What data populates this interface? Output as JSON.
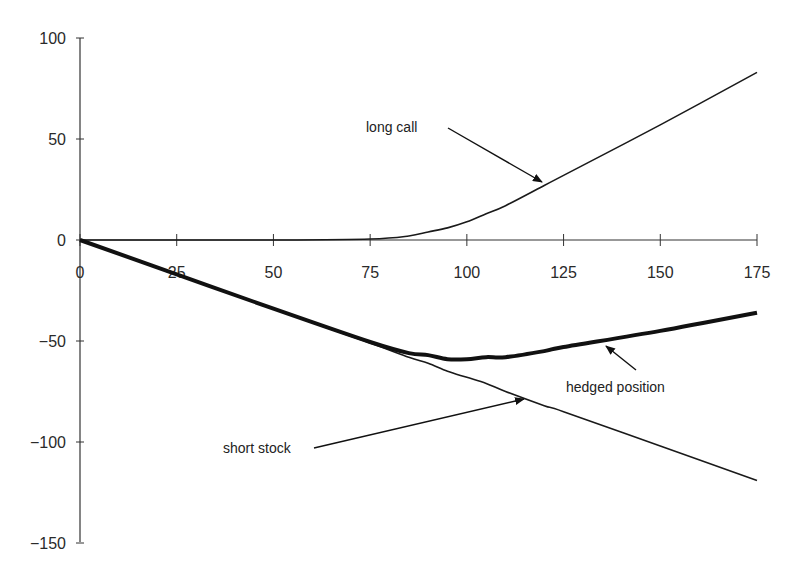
{
  "chart_data": {
    "type": "line",
    "title": "",
    "xlabel": "",
    "ylabel": "",
    "xlim": [
      0,
      175
    ],
    "ylim": [
      -150,
      100
    ],
    "x_ticks": [
      0,
      25,
      50,
      75,
      100,
      125,
      150,
      175
    ],
    "y_ticks": [
      100,
      50,
      0,
      -50,
      -100,
      -150
    ],
    "grid": false,
    "legend": "none (inline arrow annotations)",
    "x": [
      0,
      25,
      50,
      75,
      85,
      90,
      95,
      100,
      105,
      110,
      120,
      125,
      150,
      175
    ],
    "series": [
      {
        "name": "long call",
        "values": [
          0,
          0,
          0,
          0.5,
          2,
          4,
          6,
          9,
          13,
          17,
          27,
          32,
          57,
          83
        ],
        "style": "thin"
      },
      {
        "name": "short stock",
        "values": [
          0,
          -17,
          -34,
          -51,
          -58,
          -61,
          -65,
          -68,
          -71,
          -75,
          -82,
          -85,
          -102,
          -119
        ],
        "style": "thin"
      },
      {
        "name": "hedged position",
        "values": [
          0,
          -17,
          -34,
          -50.5,
          -56,
          -57,
          -59,
          -59,
          -58,
          -58,
          -55,
          -53,
          -45,
          -36
        ],
        "style": "thick"
      }
    ],
    "annotations": [
      {
        "text": "long call",
        "points_to": "long call"
      },
      {
        "text": "hedged position",
        "points_to": "hedged position"
      },
      {
        "text": "short stock",
        "points_to": "short stock"
      }
    ]
  },
  "labels": {
    "y_ticks": [
      "100",
      "50",
      "0",
      "−50",
      "−100",
      "−150"
    ],
    "x_ticks": [
      "0",
      "25",
      "50",
      "75",
      "100",
      "125",
      "150",
      "175"
    ],
    "long_call": "long call",
    "hedged_position": "hedged position",
    "short_stock": "short stock"
  }
}
